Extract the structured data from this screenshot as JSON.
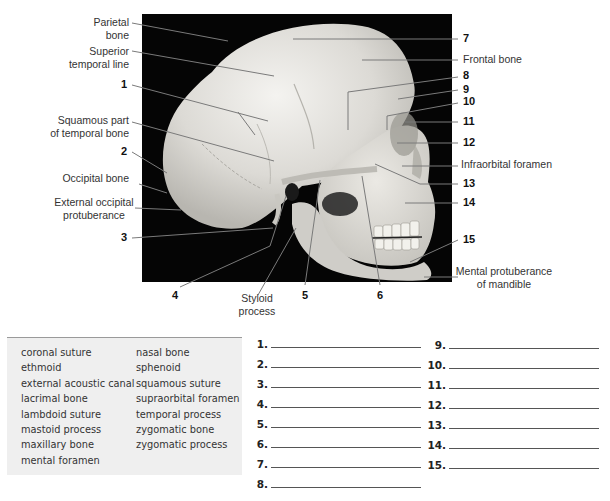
{
  "figure": {
    "named_labels": {
      "parietal_bone": [
        "Parietal",
        "bone"
      ],
      "superior_temporal_line": [
        "Superior",
        "temporal line"
      ],
      "squamous_part": [
        "Squamous part",
        "of temporal bone"
      ],
      "occipital_bone": "Occipital bone",
      "external_occipital_protuberance": [
        "External occipital",
        "protuberance"
      ],
      "styloid_process": [
        "Styloid",
        "process"
      ],
      "frontal_bone": "Frontal bone",
      "infraorbital_foramen": "Infraorbital foramen",
      "mental_protuberance": [
        "Mental protuberance",
        "of mandible"
      ]
    },
    "numbers": [
      "1",
      "2",
      "3",
      "4",
      "5",
      "6",
      "7",
      "8",
      "9",
      "10",
      "11",
      "12",
      "13",
      "14",
      "15"
    ]
  },
  "word_bank": {
    "col1": [
      "coronal suture",
      "ethmoid",
      "external acoustic canal",
      "lacrimal bone",
      "lambdoid suture",
      "mastoid process",
      "maxillary bone",
      "mental foramen"
    ],
    "col2": [
      "nasal bone",
      "sphenoid",
      "squamous suture",
      "supraorbital foramen",
      "temporal process",
      "zygomatic bone",
      "zygomatic process"
    ]
  },
  "answers": {
    "left": [
      "1.",
      "2.",
      "3.",
      "4.",
      "5.",
      "6.",
      "7.",
      "8."
    ],
    "right": [
      "9.",
      "10.",
      "11.",
      "12.",
      "13.",
      "14.",
      "15."
    ]
  }
}
